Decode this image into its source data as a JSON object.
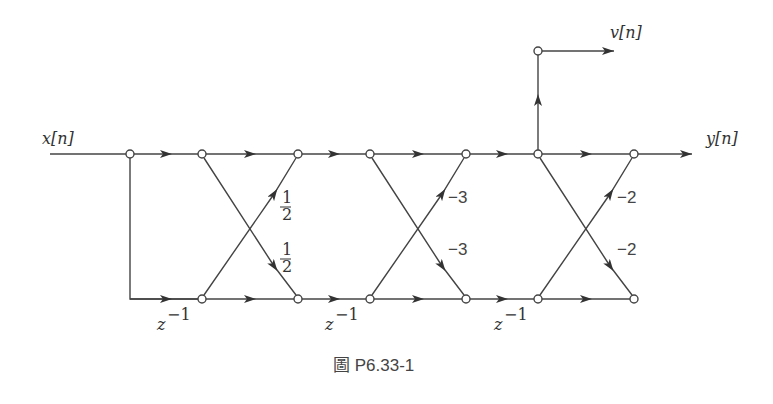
{
  "diagram": {
    "type": "signal-flow-graph",
    "caption": "圖 P6.33-1",
    "labels": {
      "input": "x[n]",
      "output_y": "y[n]",
      "output_v": "v[n]"
    },
    "delays": [
      "z⁻¹",
      "z⁻¹",
      "z⁻¹"
    ],
    "delay_base": "z",
    "delay_exp": "−1",
    "stages": [
      {
        "upper_gain": "1/2",
        "lower_gain": "1/2",
        "upper_num": "1",
        "upper_den": "2",
        "lower_num": "1",
        "lower_den": "2"
      },
      {
        "upper_gain": "−3",
        "lower_gain": "−3"
      },
      {
        "upper_gain": "−2",
        "lower_gain": "−2"
      }
    ],
    "colors": {
      "line": "#444444",
      "node_fill": "#ffffff"
    }
  }
}
